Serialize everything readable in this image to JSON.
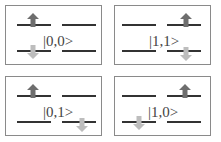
{
  "diagram": {
    "colors": {
      "level": "#333333",
      "up_arrow": "#6e6e6e",
      "down_arrow": "#bdbdbd",
      "border": "#8a8a8a"
    },
    "panels": [
      {
        "label": "|0,0>",
        "up_site": "left",
        "down_site": "left"
      },
      {
        "label": "|1,1>",
        "up_site": "right",
        "down_site": "right"
      },
      {
        "label": "|0,1>",
        "up_site": "left",
        "down_site": "right"
      },
      {
        "label": "|1,0>",
        "up_site": "right",
        "down_site": "left"
      }
    ]
  }
}
